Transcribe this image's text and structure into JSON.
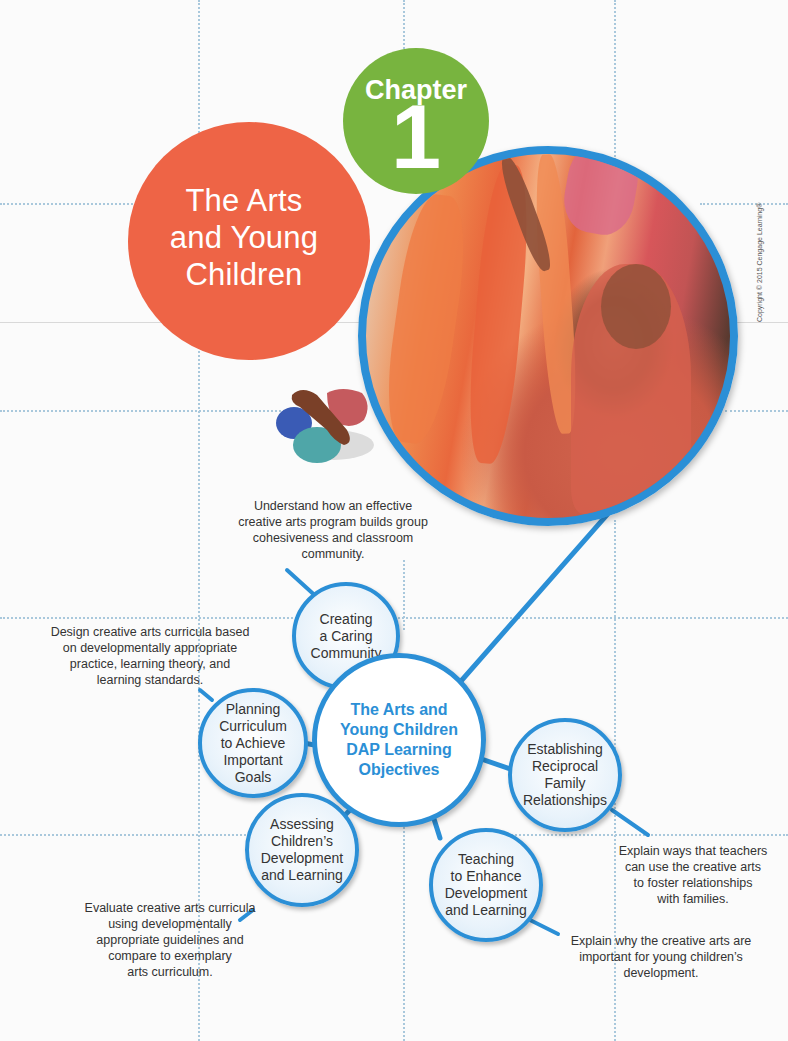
{
  "chapter": {
    "label": "Chapter",
    "number": "1",
    "title_lines": [
      "The Arts",
      "and Young",
      "Children"
    ]
  },
  "photo": {
    "description": "Child painting with orange paint on a large paper, wearing an orange smock",
    "copyright": "Copyright © 2015 Cengage Learning®"
  },
  "map": {
    "center_label_lines": [
      "The Arts and",
      "Young Children",
      "DAP Learning",
      "Objectives"
    ],
    "nodes": [
      {
        "id": "creating",
        "label_lines": [
          "Creating",
          "a Caring",
          "Community"
        ],
        "description_lines": [
          "Understand how an effective",
          "creative arts program builds group",
          "cohesiveness and classroom",
          "community."
        ]
      },
      {
        "id": "planning",
        "label_lines": [
          "Planning",
          "Curriculum",
          "to Achieve",
          "Important",
          "Goals"
        ],
        "description_lines": [
          "Design creative arts curricula based",
          "on developmentally appropriate",
          "practice, learning theory, and",
          "learning standards."
        ]
      },
      {
        "id": "establishing",
        "label_lines": [
          "Establishing",
          "Reciprocal",
          "Family",
          "Relationships"
        ],
        "description_lines": [
          "Explain ways that teachers",
          "can use the creative arts",
          "to foster relationships",
          "with families."
        ]
      },
      {
        "id": "assessing",
        "label_lines": [
          "Assessing",
          "Children’s",
          "Development",
          "and Learning"
        ],
        "description_lines": [
          "Evaluate creative arts curricula",
          "using developmentally",
          "appropriate guidelines and",
          "compare to exemplary",
          "arts curriculum."
        ]
      },
      {
        "id": "teaching",
        "label_lines": [
          "Teaching",
          "to Enhance",
          "Development",
          "and Learning"
        ],
        "description_lines": [
          "Explain why the creative arts are",
          "important for young children’s",
          "development."
        ]
      }
    ]
  },
  "colors": {
    "orange": "#ee6446",
    "green": "#78b43f",
    "blue": "#2b8fd6",
    "grid": "#a9c8dc"
  }
}
